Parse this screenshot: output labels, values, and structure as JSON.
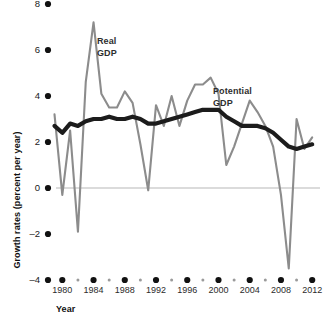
{
  "chart_data": {
    "type": "line",
    "title": "",
    "xlabel": "Year",
    "ylabel": "Growth rates (percent per year)",
    "xlim": [
      1979,
      2013
    ],
    "ylim": [
      -4,
      8
    ],
    "grid": false,
    "zero_line": true,
    "legend": "inline-annotations",
    "x_major_ticks": [
      1980,
      1984,
      1988,
      1992,
      1996,
      2000,
      2004,
      2008,
      2012
    ],
    "x_major_tick_labels": [
      "1980",
      "1984",
      "1988",
      "1992",
      "1996",
      "2000",
      "2004",
      "2008",
      "2012"
    ],
    "x_minor_ticks": [
      1982,
      1986,
      1990,
      1994,
      1998,
      2002,
      2006,
      2010
    ],
    "y_ticks": [
      -4,
      -2,
      0,
      2,
      4,
      6,
      8
    ],
    "y_tick_labels": [
      "–4",
      "–2",
      "0",
      "2",
      "4",
      "6",
      "8"
    ],
    "x": [
      1979,
      1980,
      1981,
      1982,
      1983,
      1984,
      1985,
      1986,
      1987,
      1988,
      1989,
      1990,
      1991,
      1992,
      1993,
      1994,
      1995,
      1996,
      1997,
      1998,
      1999,
      2000,
      2001,
      2002,
      2003,
      2004,
      2005,
      2006,
      2007,
      2008,
      2009,
      2010,
      2011,
      2012
    ],
    "series": [
      {
        "name": "Real GDP",
        "color": "#8c8c8c",
        "label": "Real\nGDP",
        "label_line1": "Real",
        "label_line2": "GDP",
        "values": [
          3.2,
          -0.3,
          2.5,
          -1.9,
          4.6,
          7.2,
          4.1,
          3.5,
          3.5,
          4.2,
          3.7,
          1.9,
          -0.1,
          3.6,
          2.7,
          4.0,
          2.7,
          3.8,
          4.5,
          4.5,
          4.8,
          4.1,
          1.0,
          1.8,
          2.8,
          3.8,
          3.3,
          2.7,
          1.8,
          -0.3,
          -3.5,
          3.0,
          1.7,
          2.2
        ]
      },
      {
        "name": "Potential GDP",
        "color": "#1c1c1c",
        "label": "Potential\nGDP",
        "label_line1": "Potential",
        "label_line2": "GDP",
        "values": [
          2.7,
          2.4,
          2.8,
          2.7,
          2.9,
          3.0,
          3.0,
          3.1,
          3.0,
          3.0,
          3.1,
          3.0,
          2.8,
          2.8,
          2.9,
          3.0,
          3.1,
          3.2,
          3.3,
          3.4,
          3.4,
          3.4,
          3.1,
          2.9,
          2.7,
          2.7,
          2.7,
          2.6,
          2.4,
          2.1,
          1.8,
          1.7,
          1.8,
          1.9
        ]
      }
    ]
  },
  "annotations": {
    "real_gdp_label_line1": "Real",
    "real_gdp_label_line2": "GDP",
    "potential_gdp_label_line1": "Potential",
    "potential_gdp_label_line2": "GDP"
  },
  "axes": {
    "x_axis_title": "Year",
    "y_axis_title": "Growth rates (percent per year)"
  },
  "colors": {
    "real_gdp": "#8c8c8c",
    "potential_gdp": "#1c1c1c",
    "zero_line": "#b8b8b8",
    "tick_dot": "#111111",
    "minor_tick_dot": "#9a9a9a",
    "background": "#ffffff"
  }
}
